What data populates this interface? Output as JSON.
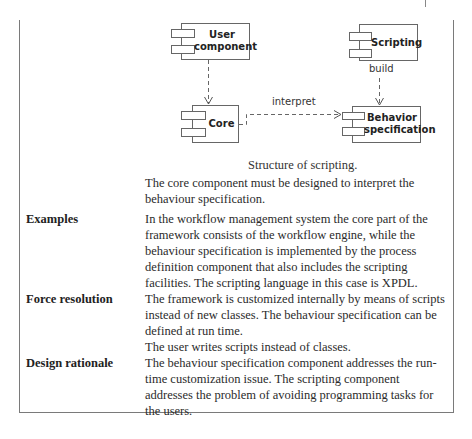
{
  "diagram": {
    "components": [
      {
        "id": "user_component",
        "label_line1": "User",
        "label_line2": "component"
      },
      {
        "id": "scripting",
        "label": "Scripting"
      },
      {
        "id": "core",
        "label": "Core"
      },
      {
        "id": "behavior_specification",
        "label_line1": "Behavior",
        "label_line2": "specification"
      }
    ],
    "edges": [
      {
        "from": "user_component",
        "to": "core",
        "label": ""
      },
      {
        "from": "scripting",
        "to": "behavior_specification",
        "label": "build"
      },
      {
        "from": "core",
        "to": "behavior_specification",
        "label": "interpret"
      }
    ],
    "caption": "Structure of scripting."
  },
  "intro": {
    "text": "The core component must be designed to interpret the behaviour specification."
  },
  "sections": [
    {
      "label": "Examples",
      "paragraphs": [
        "In the workflow management system the core part of the framework consists of the workflow engine, while the behaviour specification is implemented by the process definition component that also includes the scripting facilities. The scripting language in this case is XPDL."
      ]
    },
    {
      "label": "Force resolution",
      "paragraphs": [
        "The framework is customized internally by means of scripts instead of new classes. The behaviour specification can be defined at run time.",
        "The user writes scripts instead of classes."
      ]
    },
    {
      "label": "Design rationale",
      "paragraphs": [
        "The behaviour specification component addresses the run-time customization issue. The scripting component addresses the problem of avoiding programming tasks for the users."
      ]
    }
  ]
}
